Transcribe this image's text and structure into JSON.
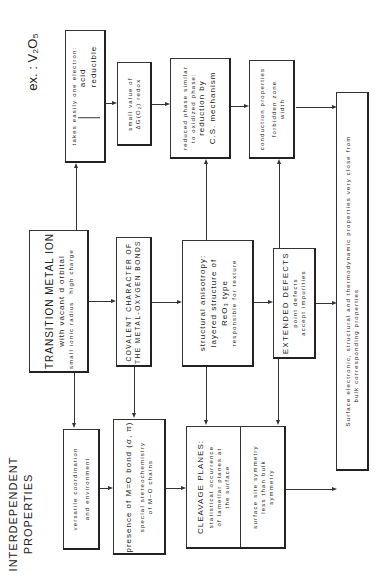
{
  "title": {
    "line1": "INTERDEPENDENT",
    "line2": "PROPERTIES"
  },
  "example": "ex. : V₂O₅",
  "boxes": {
    "electron": {
      "line1": "takes easily one electron:",
      "line2": "acid",
      "line3": "reducible"
    },
    "deltaG": {
      "line1": "small value of",
      "line2": "ΔG(O₂) redox"
    },
    "reduced": {
      "line1": "reduced phase similar",
      "line2": "to oxidized phase:",
      "line3": "reduction by",
      "line4": "C.S. mechanism"
    },
    "conduction": {
      "line1": "conduction properties",
      "line2": "forbidden zone",
      "line3": "width"
    },
    "surface": {
      "line1": "Surface electronic, structural and thermodynamic properties very close from",
      "line2": "bulk corresponding properties"
    },
    "transition": {
      "line1": "TRANSITION METAL ION",
      "line2": "with vacant d orbital",
      "small_radius": "small ionic radius",
      "high_charge": "high charge"
    },
    "covalent": {
      "line1": "COVALENT CHARACTER OF",
      "line2": "THE METAL-OXYGEN BONDS"
    },
    "anisotropy": {
      "line1": "structural anisotropy:",
      "line2": "layered structure of",
      "line3": "ReO₃ type",
      "line4": "responsible for texture"
    },
    "defects": {
      "line1": "EXTENDED DEFECTS",
      "line2": "point defects",
      "line3": "accept impurities"
    },
    "versatile": {
      "line1": "versatile coordination",
      "line2": "and environment"
    },
    "presence": {
      "line1": "presence of M=O bond (σ, π)",
      "line2": "special stereochemistry",
      "line3": "of M–O chains"
    },
    "cleavage": {
      "line1": "CLEAVAGE PLANES:",
      "line2": "statistical occurrence",
      "line3": "of lamellar planes at",
      "line4": "the surface",
      "right1": "surface site symmetry",
      "right2": "less than bulk",
      "right3": "symmetry"
    }
  }
}
